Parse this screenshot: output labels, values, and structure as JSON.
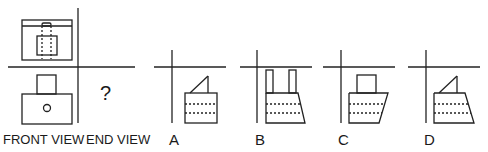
{
  "question": {
    "unknown_symbol": "?",
    "labels": {
      "front_view": "FRONT VIEW",
      "end_view": "END VIEW"
    }
  },
  "options": [
    {
      "letter": "A",
      "shape": "rectangle-with-triangle-top"
    },
    {
      "letter": "B",
      "shape": "trapezoid-with-two-posts"
    },
    {
      "letter": "C",
      "shape": "trapezoid-with-square-top"
    },
    {
      "letter": "D",
      "shape": "trapezoid-with-triangle-top"
    }
  ],
  "colors": {
    "line": "#222222",
    "background": "#ffffff"
  }
}
